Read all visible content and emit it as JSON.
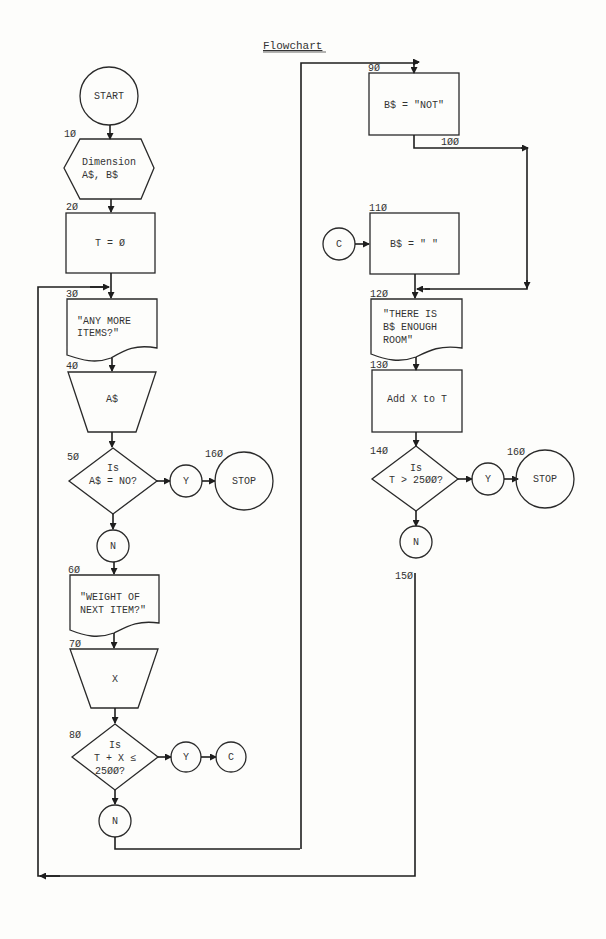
{
  "title": "Flowchart",
  "nodes": {
    "start": {
      "text": "START"
    },
    "n10": {
      "label": "1Ø",
      "lines": [
        "Dimension",
        "A$, B$"
      ]
    },
    "n20": {
      "label": "2Ø",
      "text": "T = Ø"
    },
    "n30": {
      "label": "3Ø",
      "lines": [
        "\"ANY MORE",
        "ITEMS?\""
      ]
    },
    "n40": {
      "label": "4Ø",
      "text": "A$"
    },
    "n50": {
      "label": "5Ø",
      "lines": [
        "Is",
        "A$ = NO?"
      ]
    },
    "n50_yes": {
      "text": "Y"
    },
    "n50_no": {
      "text": "N"
    },
    "stop_left": {
      "label": "16Ø",
      "text": "STOP"
    },
    "n60": {
      "label": "6Ø",
      "lines": [
        "\"WEIGHT OF",
        "NEXT ITEM?\""
      ]
    },
    "n70": {
      "label": "7Ø",
      "text": "X"
    },
    "n80": {
      "label": "8Ø",
      "lines": [
        "Is",
        "T + X ≤",
        "25ØØ?"
      ]
    },
    "n80_yes": {
      "text": "Y"
    },
    "n80_c": {
      "text": "C"
    },
    "n80_no": {
      "text": "N"
    },
    "n90": {
      "label": "9Ø",
      "text": "B$ = \"NOT\""
    },
    "n100": {
      "label": "1ØØ"
    },
    "n110": {
      "label": "11Ø",
      "text": "B$ = \"  \""
    },
    "n110_c": {
      "text": "C"
    },
    "n120": {
      "label": "12Ø",
      "lines": [
        "\"THERE IS",
        "B$ ENOUGH",
        "ROOM\""
      ]
    },
    "n130": {
      "label": "13Ø",
      "text": "Add X to T"
    },
    "n140": {
      "label": "14Ø",
      "lines": [
        "Is",
        "T > 25ØØ?"
      ]
    },
    "n140_yes": {
      "text": "Y"
    },
    "n140_no": {
      "text": "N"
    },
    "stop_right": {
      "label": "16Ø",
      "text": "STOP"
    },
    "n150": {
      "label": "15Ø"
    }
  }
}
